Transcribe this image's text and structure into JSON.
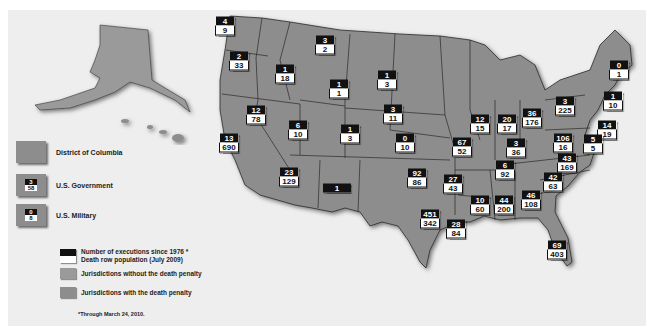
{
  "colors": {
    "background": "#eeeeee",
    "death_penalty_state": "#8d8d8d",
    "no_death_penalty_state": "#9a9a9a",
    "state_border": "#2a2a2a",
    "execution_box": "#111111",
    "death_row_box": "#ffffff"
  },
  "legend": {
    "dc": "District of Columbia",
    "us_gov": {
      "label": "U.S. Government",
      "executions": "3",
      "death_row": "58"
    },
    "us_mil": {
      "label": "U.S. Military",
      "executions": "0",
      "death_row": "8"
    },
    "key_executions": "Number of executions since 1976 *",
    "key_death_row": "Death row population (July 2009)",
    "without_penalty": "Jurisdictions without the death penalty",
    "with_penalty": "Jurisdictions with the death penalty",
    "footnote": "*Through March 24, 2010."
  },
  "states": [
    {
      "name": "washington",
      "executions": "4",
      "death_row": "9",
      "x": 225,
      "y": 26
    },
    {
      "name": "oregon",
      "executions": "2",
      "death_row": "33",
      "x": 239,
      "y": 61
    },
    {
      "name": "idaho",
      "executions": "1",
      "death_row": "18",
      "x": 285,
      "y": 74
    },
    {
      "name": "montana",
      "executions": "3",
      "death_row": "2",
      "x": 325,
      "y": 45
    },
    {
      "name": "wyoming",
      "executions": "1",
      "death_row": "1",
      "x": 339,
      "y": 89
    },
    {
      "name": "nevada",
      "executions": "12",
      "death_row": "78",
      "x": 256,
      "y": 115
    },
    {
      "name": "california",
      "executions": "13",
      "death_row": "690",
      "x": 229,
      "y": 143
    },
    {
      "name": "utah",
      "executions": "6",
      "death_row": "10",
      "x": 298,
      "y": 130
    },
    {
      "name": "colorado",
      "executions": "1",
      "death_row": "3",
      "x": 350,
      "y": 134
    },
    {
      "name": "arizona",
      "executions": "23",
      "death_row": "129",
      "x": 289,
      "y": 177
    },
    {
      "name": "new-mexico",
      "executions": "1",
      "death_row": "",
      "x": 337,
      "y": 188
    },
    {
      "name": "south-dakota",
      "executions": "1",
      "death_row": "3",
      "x": 387,
      "y": 80
    },
    {
      "name": "nebraska",
      "executions": "3",
      "death_row": "11",
      "x": 393,
      "y": 114
    },
    {
      "name": "kansas",
      "executions": "0",
      "death_row": "10",
      "x": 405,
      "y": 143
    },
    {
      "name": "oklahoma",
      "executions": "92",
      "death_row": "86",
      "x": 417,
      "y": 178
    },
    {
      "name": "texas",
      "executions": "451",
      "death_row": "342",
      "x": 430,
      "y": 219
    },
    {
      "name": "missouri",
      "executions": "67",
      "death_row": "52",
      "x": 462,
      "y": 147
    },
    {
      "name": "arkansas",
      "executions": "27",
      "death_row": "43",
      "x": 453,
      "y": 184
    },
    {
      "name": "louisiana",
      "executions": "28",
      "death_row": "84",
      "x": 456,
      "y": 229
    },
    {
      "name": "mississippi",
      "executions": "10",
      "death_row": "60",
      "x": 480,
      "y": 205
    },
    {
      "name": "alabama",
      "executions": "44",
      "death_row": "200",
      "x": 504,
      "y": 205
    },
    {
      "name": "tennessee",
      "executions": "6",
      "death_row": "92",
      "x": 505,
      "y": 170
    },
    {
      "name": "illinois",
      "executions": "12",
      "death_row": "15",
      "x": 480,
      "y": 124
    },
    {
      "name": "indiana",
      "executions": "20",
      "death_row": "17",
      "x": 507,
      "y": 124
    },
    {
      "name": "ohio",
      "executions": "36",
      "death_row": "176",
      "x": 532,
      "y": 118
    },
    {
      "name": "kentucky",
      "executions": "3",
      "death_row": "36",
      "x": 516,
      "y": 148
    },
    {
      "name": "pennsylvania",
      "executions": "3",
      "death_row": "225",
      "x": 565,
      "y": 106
    },
    {
      "name": "virginia",
      "executions": "106",
      "death_row": "16",
      "x": 563,
      "y": 143
    },
    {
      "name": "north-carolina",
      "executions": "43",
      "death_row": "169",
      "x": 567,
      "y": 163
    },
    {
      "name": "south-carolina",
      "executions": "42",
      "death_row": "63",
      "x": 553,
      "y": 182
    },
    {
      "name": "georgia",
      "executions": "46",
      "death_row": "108",
      "x": 531,
      "y": 200
    },
    {
      "name": "florida",
      "executions": "69",
      "death_row": "403",
      "x": 557,
      "y": 250
    },
    {
      "name": "new-hampshire",
      "executions": "0",
      "death_row": "1",
      "x": 619,
      "y": 70
    },
    {
      "name": "connecticut",
      "executions": "1",
      "death_row": "10",
      "x": 613,
      "y": 101
    },
    {
      "name": "delaware",
      "executions": "14",
      "death_row": "19",
      "x": 607,
      "y": 130
    },
    {
      "name": "maryland",
      "executions": "5",
      "death_row": "5",
      "x": 593,
      "y": 144
    }
  ]
}
